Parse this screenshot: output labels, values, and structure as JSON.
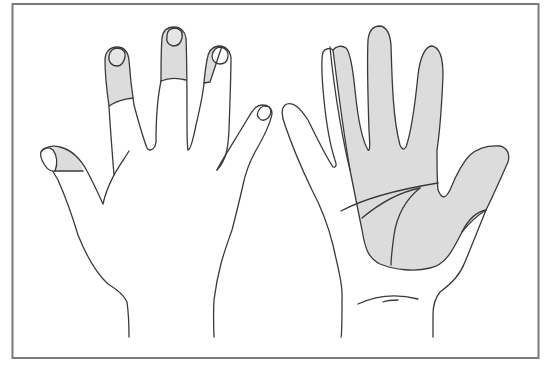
{
  "figure": {
    "colors": {
      "frame": "#7a7a7a",
      "outline": "#3a3a3a",
      "shade": "#dcdcdc",
      "background": "#ffffff"
    },
    "hands": [
      {
        "name": "left-hand-dorsal",
        "view": "back of hand",
        "shaded_regions": [
          "thumb tip",
          "index finger distal+middle phalanx",
          "middle finger distal phalanx",
          "ring finger distal phalanx (radial half)"
        ]
      },
      {
        "name": "right-hand-palmar",
        "view": "palm",
        "shaded_regions": [
          "palm (radial side)",
          "thumb",
          "index finger",
          "middle finger",
          "ring finger (radial half)"
        ]
      }
    ]
  }
}
